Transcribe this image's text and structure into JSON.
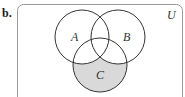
{
  "part_label": "b.",
  "universe_label": "U",
  "sets": [
    {
      "label": "A",
      "cx": 82,
      "cy": 37,
      "r": 27,
      "label_x": 72,
      "label_y": 41
    },
    {
      "label": "B",
      "cx": 118,
      "cy": 37,
      "r": 27,
      "label_x": 124,
      "label_y": 41
    },
    {
      "label": "C",
      "cx": 100,
      "cy": 65,
      "r": 27,
      "label_x": 96,
      "label_y": 78
    }
  ],
  "shaded_region": "C only (C minus A and B)",
  "colors": {
    "shade": "#d9d9d9",
    "stroke": "#333333",
    "box_stroke": "#9a9a9a"
  }
}
